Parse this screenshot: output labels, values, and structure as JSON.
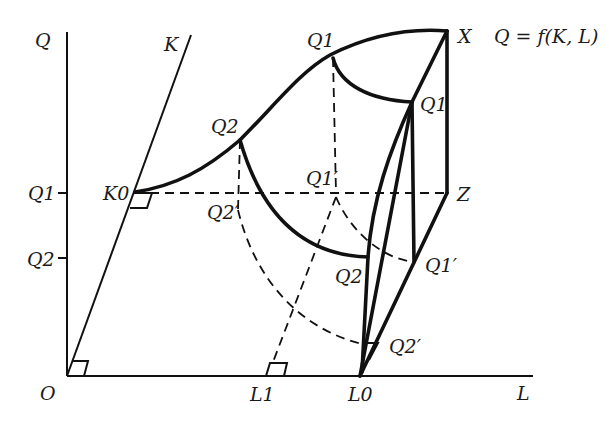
{
  "diagram": {
    "equation": "Q = f(K, L)",
    "axes": {
      "vertical": "Q",
      "capital": "K",
      "labor": "L",
      "origin": "O"
    },
    "q_axis_ticks": [
      "Q1",
      "Q2"
    ],
    "l_axis_ticks": [
      "L1",
      "L0"
    ],
    "points": {
      "K0": "K0",
      "X": "X",
      "Z": "Z",
      "Q1_top": "Q1",
      "Q1_right": "Q1",
      "Q2_curve": "Q2",
      "Q2_lower": "Q2",
      "Q1_prime_center": "Q1′",
      "Q1_prime_right": "Q1′",
      "Q2_prime_left": "Q2′",
      "Q2_prime_right": "Q2′"
    }
  }
}
